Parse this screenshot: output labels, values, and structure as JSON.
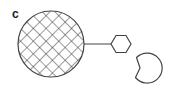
{
  "panel": {
    "label": "c"
  },
  "diagram": {
    "stroke_color": "#444444",
    "background": "#ffffff",
    "elements": [
      {
        "type": "circle",
        "name": "cross-hatched-sphere",
        "cx": 51,
        "cy": 44,
        "r": 33,
        "fill": "crosshatch"
      },
      {
        "type": "line",
        "name": "connector",
        "x1": 84,
        "y1": 44,
        "x2": 111,
        "y2": 44
      },
      {
        "type": "hexagon",
        "name": "hexagon",
        "cx": 121,
        "cy": 44,
        "r": 10
      },
      {
        "type": "pacman",
        "name": "notched-circle",
        "cx": 148,
        "cy": 68,
        "r": 15,
        "mouth": "left"
      }
    ]
  }
}
